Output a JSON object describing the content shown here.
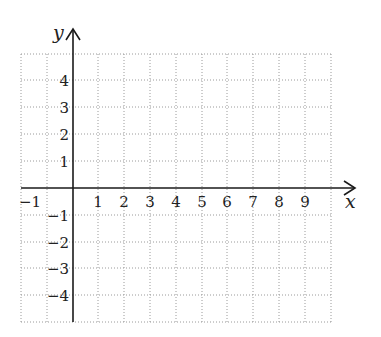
{
  "diagram": {
    "type": "coordinate-grid",
    "x_axis": {
      "label": "x",
      "range": [
        -2,
        10
      ],
      "tick_labels": [
        "-1",
        "1",
        "2",
        "3",
        "4",
        "5",
        "6",
        "7",
        "8",
        "9"
      ]
    },
    "y_axis": {
      "label": "y",
      "range": [
        -5,
        5
      ],
      "tick_labels": [
        "4",
        "3",
        "2",
        "1",
        "-1",
        "-2",
        "-3",
        "-4"
      ]
    },
    "grid": {
      "style": "dotted",
      "color": "#9a9a9a",
      "cell_size_px": 26
    },
    "axis_color": "#1a1a1a"
  },
  "labels": {
    "x": "x",
    "y": "y",
    "xm1": "−1",
    "x1": "1",
    "x2": "2",
    "x3": "3",
    "x4": "4",
    "x5": "5",
    "x6": "6",
    "x7": "7",
    "x8": "8",
    "x9": "9",
    "y4": "4",
    "y3": "3",
    "y2": "2",
    "y1": "1",
    "ym1": "−1",
    "ym2": "−2",
    "ym3": "−3",
    "ym4": "−4"
  }
}
